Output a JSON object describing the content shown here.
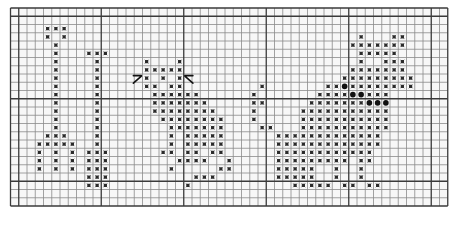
{
  "grid": {
    "cols": 53,
    "rows": 24,
    "origin_x": 10.5,
    "origin_y": 8,
    "cell": 8.25,
    "major_every": 10,
    "major_col_offset": 1,
    "major_row_offset": 1,
    "line_color": "#8a8a8a",
    "major_line_color": "#3a3a3a",
    "background": "#f7f7f7"
  },
  "symbols": {
    "x": {
      "name": "cross-stitch",
      "color": "#2a2a2a",
      "size": 3.2
    },
    "dot": {
      "name": "french-knot",
      "color": "#111111",
      "size": 5.6
    }
  },
  "stitches": [
    {
      "row": 2,
      "cols": [
        4,
        5,
        6
      ]
    },
    {
      "row": 3,
      "cols": [
        4,
        6,
        42,
        46,
        47
      ]
    },
    {
      "row": 4,
      "cols": [
        5,
        41,
        42,
        43,
        44,
        45,
        46,
        47
      ]
    },
    {
      "row": 5,
      "cols": [
        5,
        9,
        10,
        11,
        42,
        43,
        44,
        45,
        46
      ]
    },
    {
      "row": 6,
      "cols": [
        5,
        10,
        16,
        20,
        42,
        45,
        46,
        47
      ]
    },
    {
      "row": 7,
      "cols": [
        5,
        10,
        16,
        17,
        18,
        19,
        20,
        41,
        42,
        43,
        44,
        45,
        46,
        47
      ]
    },
    {
      "row": 8,
      "cols": [
        5,
        10,
        16,
        18,
        20,
        40,
        41,
        42,
        43,
        44,
        45,
        46,
        47,
        48
      ]
    },
    {
      "row": 9,
      "cols": [
        5,
        10,
        16,
        17,
        19,
        20,
        30,
        38,
        39,
        41,
        42,
        43,
        44,
        45,
        46,
        47,
        48
      ],
      "dots": [
        40
      ]
    },
    {
      "row": 10,
      "cols": [
        5,
        10,
        17,
        18,
        19,
        20,
        21,
        22,
        29,
        37,
        38,
        39,
        40,
        43,
        44,
        45
      ],
      "dots": [
        41,
        42
      ]
    },
    {
      "row": 11,
      "cols": [
        5,
        10,
        17,
        18,
        19,
        20,
        21,
        22,
        23,
        29,
        30,
        36,
        37,
        38,
        39,
        40,
        41,
        42
      ],
      "dots": [
        43,
        44,
        45
      ]
    },
    {
      "row": 12,
      "cols": [
        5,
        10,
        17,
        18,
        19,
        20,
        21,
        22,
        23,
        24,
        29,
        35,
        36,
        37,
        38,
        39,
        40,
        41,
        42,
        43,
        44,
        45
      ]
    },
    {
      "row": 13,
      "cols": [
        5,
        10,
        18,
        19,
        20,
        21,
        22,
        23,
        24,
        25,
        29,
        35,
        36,
        37,
        38,
        39,
        40,
        41,
        42,
        43,
        44,
        45
      ]
    },
    {
      "row": 14,
      "cols": [
        5,
        10,
        19,
        20,
        21,
        22,
        23,
        24,
        25,
        30,
        31,
        35,
        36,
        37,
        38,
        39,
        40,
        41,
        42,
        43,
        44,
        45
      ]
    },
    {
      "row": 15,
      "cols": [
        4,
        5,
        6,
        10,
        19,
        21,
        22,
        23,
        24,
        25,
        32,
        33,
        34,
        35,
        36,
        37,
        38,
        39,
        40,
        41,
        42,
        43,
        44
      ]
    },
    {
      "row": 16,
      "cols": [
        3,
        4,
        5,
        6,
        7,
        10,
        19,
        21,
        22,
        23,
        24,
        25,
        32,
        33,
        34,
        35,
        36,
        37,
        38,
        39,
        40,
        41,
        42,
        43,
        44
      ]
    },
    {
      "row": 17,
      "cols": [
        3,
        5,
        7,
        9,
        10,
        11,
        18,
        19,
        21,
        22,
        24,
        25,
        32,
        33,
        34,
        35,
        36,
        37,
        38,
        39,
        40,
        41,
        42,
        43
      ]
    },
    {
      "row": 18,
      "cols": [
        3,
        5,
        7,
        9,
        10,
        11,
        20,
        21,
        22,
        23,
        26,
        32,
        33,
        34,
        35,
        36,
        37,
        38,
        39,
        40,
        42,
        43
      ]
    },
    {
      "row": 19,
      "cols": [
        3,
        5,
        7,
        9,
        10,
        11,
        19,
        25,
        26,
        32,
        33,
        34,
        35,
        36,
        39,
        42
      ]
    },
    {
      "row": 20,
      "cols": [
        9,
        10,
        11,
        22,
        23,
        24,
        32,
        33,
        34,
        35,
        36,
        39,
        42
      ]
    },
    {
      "row": 21,
      "cols": [
        9,
        10,
        11,
        21,
        34,
        35,
        36,
        37,
        38,
        40,
        41,
        43,
        44
      ]
    }
  ],
  "arrows": [
    {
      "name": "arrow-up-right",
      "row": 8,
      "col": 15,
      "direction": "up-right"
    },
    {
      "name": "arrow-up-left",
      "row": 8,
      "col": 21,
      "direction": "up-left"
    }
  ]
}
